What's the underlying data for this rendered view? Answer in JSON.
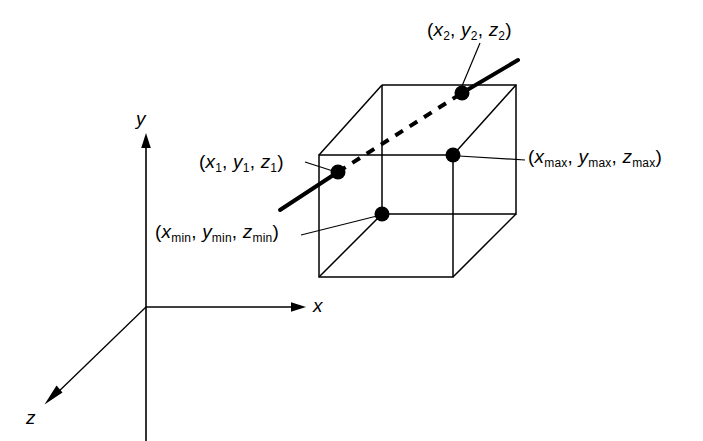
{
  "figure": {
    "background_color": "#ffffff",
    "stroke_color": "#000000",
    "width": 703,
    "height": 441
  },
  "axes": {
    "origin": {
      "x": 146,
      "y": 307
    },
    "items": [
      {
        "name": "x-axis",
        "label": "x",
        "direction": "right",
        "tip": {
          "x": 305,
          "y": 307
        },
        "label_pos": {
          "x": 313,
          "y": 297
        }
      },
      {
        "name": "y-axis",
        "label": "y",
        "direction": "up",
        "tip": {
          "x": 146,
          "y": 134
        },
        "label_pos": {
          "x": 136,
          "y": 110
        }
      },
      {
        "name": "z-axis",
        "label": "z",
        "direction": "down-left",
        "tip": {
          "x": 45,
          "y": 403
        },
        "label_pos": {
          "x": 26,
          "y": 408
        }
      }
    ]
  },
  "box": {
    "name": "bounding-box",
    "vertices": {
      "front_top_left": {
        "x": 319,
        "y": 155
      },
      "front_top_right": {
        "x": 453,
        "y": 155
      },
      "front_bottom_left": {
        "x": 319,
        "y": 277
      },
      "front_bottom_right": {
        "x": 453,
        "y": 277
      },
      "back_top_left": {
        "x": 382,
        "y": 85
      },
      "back_top_right": {
        "x": 516,
        "y": 85
      },
      "back_bottom_left": {
        "x": 382,
        "y": 214
      },
      "back_bottom_right": {
        "x": 516,
        "y": 214
      }
    }
  },
  "line_segment": {
    "name": "clipped-line",
    "start_outside": {
      "x": 280,
      "y": 210
    },
    "end_outside": {
      "x": 518,
      "y": 60
    },
    "p1": {
      "x": 338,
      "y": 172
    },
    "p2": {
      "x": 462,
      "y": 93
    },
    "inside_style": "dashed",
    "outside_style": "solid-thick"
  },
  "points": [
    {
      "name": "point-p1",
      "x": 338,
      "y": 172
    },
    {
      "name": "point-p2",
      "x": 462,
      "y": 93
    },
    {
      "name": "point-min-corner",
      "x": 382,
      "y": 214
    },
    {
      "name": "point-max-corner",
      "x": 453,
      "y": 155
    }
  ],
  "labels": {
    "p1": {
      "text": "(x1, y1, z1)",
      "parts": [
        {
          "var": "x",
          "sub": "1"
        },
        {
          "var": "y",
          "sub": "1"
        },
        {
          "var": "z",
          "sub": "1"
        }
      ],
      "pos": {
        "x": 199,
        "y": 152
      },
      "leader_from": {
        "x": 307,
        "y": 163
      },
      "leader_to": {
        "x": 332,
        "y": 170
      }
    },
    "p2": {
      "text": "(x2, y2, z2)",
      "parts": [
        {
          "var": "x",
          "sub": "2"
        },
        {
          "var": "y",
          "sub": "2"
        },
        {
          "var": "z",
          "sub": "2"
        }
      ],
      "pos": {
        "x": 427,
        "y": 20
      },
      "leader_from": {
        "x": 479,
        "y": 42
      },
      "leader_to": {
        "x": 462,
        "y": 88
      }
    },
    "min": {
      "text": "(xmin, ymin, zmin)",
      "parts": [
        {
          "var": "x",
          "sub": "min"
        },
        {
          "var": "y",
          "sub": "min"
        },
        {
          "var": "z",
          "sub": "min"
        }
      ],
      "pos": {
        "x": 155,
        "y": 222
      },
      "leader_from": {
        "x": 303,
        "y": 234
      },
      "leader_to": {
        "x": 377,
        "y": 217
      }
    },
    "max": {
      "text": "(xmax, ymax, zmax)",
      "parts": [
        {
          "var": "x",
          "sub": "max"
        },
        {
          "var": "y",
          "sub": "max"
        },
        {
          "var": "z",
          "sub": "max"
        }
      ],
      "pos": {
        "x": 528,
        "y": 147
      },
      "leader_from": {
        "x": 524,
        "y": 160
      },
      "leader_to": {
        "x": 459,
        "y": 156
      }
    }
  }
}
